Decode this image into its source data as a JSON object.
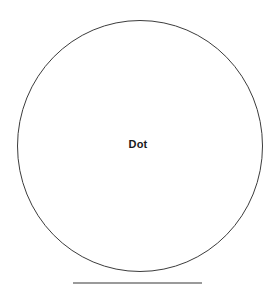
{
  "canvas": {
    "width": 276,
    "height": 288,
    "background_color": "#ffffff"
  },
  "diagram": {
    "title": "Dot",
    "label": "Dot",
    "shapes": [
      {
        "name": "circle-outline",
        "type": "ellipse",
        "center_x": 140,
        "center_y": 146,
        "radius_x": 123,
        "radius_y": 126,
        "stroke_color": "#3c3c3c",
        "stroke_width": 1,
        "fill": "none"
      },
      {
        "name": "baseline-rule",
        "type": "line",
        "x1": 73,
        "y1": 283,
        "x2": 202,
        "y2": 283,
        "stroke_color": "#9a9a9a",
        "stroke_width": 2
      }
    ],
    "label_position": {
      "x": 140,
      "y": 145
    },
    "label_color": "#1a1a1a"
  }
}
